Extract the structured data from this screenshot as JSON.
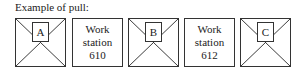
{
  "caption": "Example of pull:",
  "items": [
    {
      "type": "kanban",
      "label": "A"
    },
    {
      "type": "workstation",
      "line1": "Work",
      "line2": "station",
      "line3": "610"
    },
    {
      "type": "kanban",
      "label": "B"
    },
    {
      "type": "workstation",
      "line1": "Work",
      "line2": "station",
      "line3": "612"
    },
    {
      "type": "kanban",
      "label": "C"
    }
  ]
}
